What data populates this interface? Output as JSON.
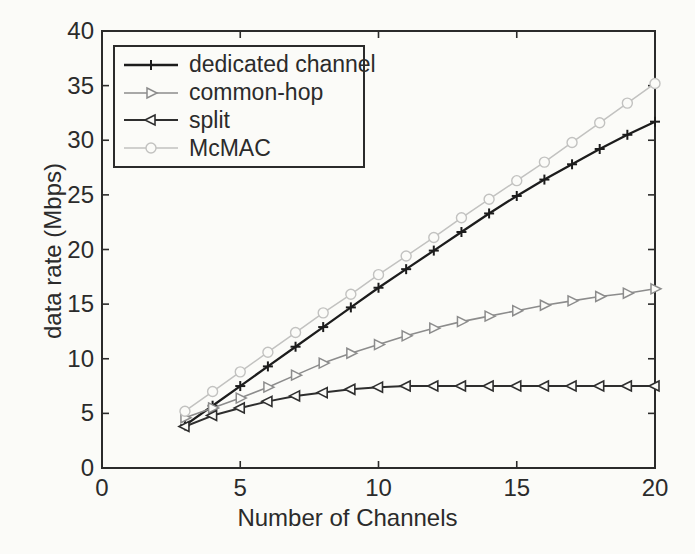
{
  "figure": {
    "background_color": "#fbfbf8",
    "axis_color": "#2b2b2b",
    "text_color": "#2b2b2b"
  },
  "chart_data": {
    "type": "line",
    "title": "",
    "xlabel": "Number of Channels",
    "ylabel": "data rate (Mbps)",
    "xlim": [
      0,
      20
    ],
    "ylim": [
      0,
      40
    ],
    "xticks": [
      0,
      5,
      10,
      15,
      20
    ],
    "yticks": [
      0,
      5,
      10,
      15,
      20,
      25,
      30,
      35,
      40
    ],
    "grid": false,
    "legend_position": "top-left",
    "x": [
      3,
      4,
      5,
      6,
      7,
      8,
      9,
      10,
      11,
      12,
      13,
      14,
      15,
      16,
      17,
      18,
      19,
      20
    ],
    "series": [
      {
        "name": "dedicated channel",
        "slug": "dedicated-channel",
        "marker": "plus",
        "color": "#1c1c1c",
        "line_width": 2.3,
        "values": [
          3.9,
          5.7,
          7.5,
          9.3,
          11.1,
          12.9,
          14.7,
          16.5,
          18.2,
          19.9,
          21.6,
          23.3,
          24.9,
          26.4,
          27.8,
          29.2,
          30.5,
          31.7
        ]
      },
      {
        "name": "common-hop",
        "slug": "common-hop",
        "marker": "triangle-right",
        "color": "#8c8c8c",
        "line_width": 1.6,
        "values": [
          4.6,
          5.5,
          6.4,
          7.4,
          8.5,
          9.6,
          10.5,
          11.3,
          12.1,
          12.8,
          13.4,
          13.9,
          14.4,
          14.9,
          15.3,
          15.7,
          16.0,
          16.4
        ]
      },
      {
        "name": "split",
        "slug": "split",
        "marker": "triangle-left",
        "color": "#2e2e2e",
        "line_width": 2.0,
        "values": [
          3.8,
          4.8,
          5.5,
          6.1,
          6.6,
          6.9,
          7.2,
          7.4,
          7.5,
          7.5,
          7.5,
          7.5,
          7.5,
          7.5,
          7.5,
          7.5,
          7.5,
          7.5
        ]
      },
      {
        "name": "McMAC",
        "slug": "mcmac",
        "marker": "circle",
        "color": "#c2c2c0",
        "line_width": 1.5,
        "values": [
          5.2,
          7.0,
          8.8,
          10.6,
          12.4,
          14.2,
          15.9,
          17.7,
          19.4,
          21.1,
          22.9,
          24.6,
          26.3,
          28.0,
          29.8,
          31.6,
          33.4,
          35.2
        ]
      }
    ]
  }
}
